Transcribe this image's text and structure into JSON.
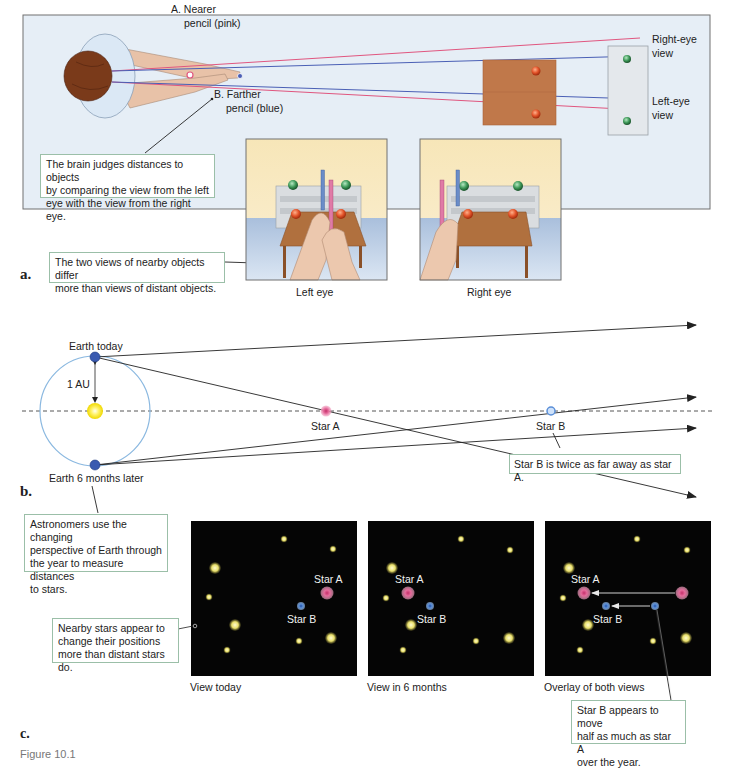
{
  "panel_a": {
    "letter": "a.",
    "nearer_pencil": [
      "A. Nearer",
      "pencil (pink)"
    ],
    "farther_pencil": [
      "B. Farther",
      "pencil (blue)"
    ],
    "right_eye_view": [
      "Right-eye",
      "view"
    ],
    "left_eye_view": [
      "Left-eye",
      "view"
    ],
    "brain_callout": [
      "The brain judges distances to objects",
      "by comparing the view from the left",
      "eye with the view from the right eye."
    ],
    "views_callout": [
      "The two views of nearby objects differ",
      "more than views of distant objects."
    ],
    "left_eye_caption": "Left eye",
    "right_eye_caption": "Right eye"
  },
  "panel_b": {
    "letter": "b.",
    "earth_today": "Earth today",
    "earth_later": "Earth 6 months later",
    "au_label": "1 AU",
    "star_a": "Star A",
    "star_b": "Star B",
    "distance_callout": "Star B is twice as far away as star A.",
    "astronomers_callout": [
      "Astronomers use the changing",
      "perspective of Earth through",
      "the year to measure distances",
      "to stars."
    ]
  },
  "panel_c": {
    "letter": "c.",
    "nearby_callout": [
      "Nearby stars appear to",
      "change their positions",
      "more than distant stars do."
    ],
    "view_today": "View today",
    "view_6_months": "View in 6 months",
    "overlay": "Overlay of both views",
    "star_a": "Star A",
    "star_b": "Star B",
    "move_callout": [
      "Star B appears to move",
      "half as much as star A",
      "over the year."
    ]
  },
  "figure_caption": "Figure 10.1",
  "colors": {
    "panel_a_bg": "#e6eef6",
    "pink_line": "#e0567f",
    "blue_line": "#4a5fb5",
    "star_yellow": "#e9e27a",
    "star_pink": "#e06a9a",
    "star_blue": "#5a8fd8",
    "orbit": "#8ab8e0",
    "sun": "#f5e43a",
    "sky": "#050505"
  }
}
